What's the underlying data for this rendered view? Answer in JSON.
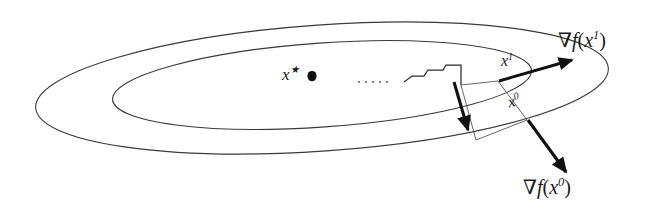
{
  "figure": {
    "background_color": "#ffffff",
    "stroke_color": "#2b2b2b",
    "arrow_color": "#111111",
    "width": 656,
    "height": 219
  },
  "labels": {
    "optimum": {
      "base": "x",
      "sup": "★",
      "text": "x★"
    },
    "iterate_1": {
      "base": "x",
      "sup": "1",
      "text": "x1"
    },
    "iterate_0": {
      "base": "x",
      "sup": "0",
      "text": "x0"
    },
    "gradient_1": {
      "prefix": "∇",
      "fn": "f",
      "open": "(",
      "base": "x",
      "sup": "1",
      "close": ")",
      "text": "∇f(x1)"
    },
    "gradient_0": {
      "prefix": "∇",
      "fn": "f",
      "open": "(",
      "base": "x",
      "sup": "0",
      "close": ")",
      "text": "∇f(x0)"
    },
    "ellipsis": "· · · · ·"
  },
  "geometry": {
    "outer_contour": {
      "type": "ellipse",
      "cx": 322,
      "cy": 88,
      "rx": 287,
      "ry": 63,
      "rotation_deg": -4
    },
    "inner_contour": {
      "type": "ellipse",
      "cx": 322,
      "cy": 85,
      "rx": 210,
      "ry": 42,
      "rotation_deg": -4
    },
    "optimum_dot": {
      "cx": 312,
      "cy": 76,
      "r": 5
    },
    "point_x1": {
      "x": 498,
      "y": 80
    },
    "point_x0": {
      "x": 527,
      "y": 119
    },
    "gradient_arrow_1": {
      "from_x": 498,
      "from_y": 80,
      "to_x": 574,
      "to_y": 59
    },
    "gradient_arrow_0": {
      "from_x": 527,
      "from_y": 119,
      "to_x": 566,
      "to_y": 175
    },
    "descent_arrow_mid": {
      "from_x": 455,
      "from_y": 83,
      "to_x": 468,
      "to_y": 133
    },
    "zigzag_points": "404,82 412,76 424,76 428,70 443,70 446,65 461,65 461,85"
  }
}
